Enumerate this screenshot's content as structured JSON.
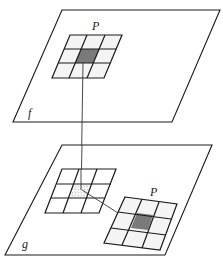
{
  "diagram": {
    "colors": {
      "shaded_cell": "#7a7a7a",
      "light_cell": "#f2f2f2",
      "stroke": "#1a1a1a",
      "background": "#ffffff"
    },
    "top_plane": {
      "label": "f",
      "grid_label": "P"
    },
    "bottom_plane": {
      "label": "g",
      "grid_label": "P"
    }
  }
}
